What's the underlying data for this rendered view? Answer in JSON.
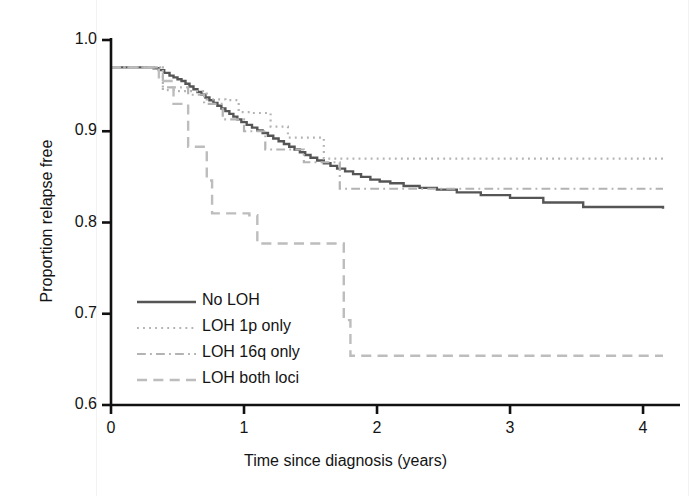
{
  "chart_data": {
    "type": "line",
    "title": "",
    "xlabel": "Time since diagnosis (years)",
    "ylabel": "Proportion relapse free",
    "xlim": [
      0,
      4.15
    ],
    "ylim": [
      0.6,
      1.005
    ],
    "xticks": [
      "0",
      "1",
      "2",
      "3",
      "4"
    ],
    "xtick_values": [
      0,
      1,
      2,
      3,
      4
    ],
    "yticks": [
      "1.0",
      "0.9",
      "0.8",
      "0.7",
      "0.6"
    ],
    "ytick_values": [
      1.0,
      0.9,
      0.8,
      0.7,
      0.6
    ],
    "grid": false,
    "legend_position": "lower-left-inside",
    "step_type": "post",
    "series": [
      {
        "name": "No LOH",
        "style": "solid",
        "color": "#555555",
        "width": 2.4,
        "x": [
          0.0,
          0.25,
          0.32,
          0.36,
          0.4,
          0.44,
          0.47,
          0.5,
          0.53,
          0.56,
          0.59,
          0.62,
          0.65,
          0.68,
          0.71,
          0.74,
          0.77,
          0.8,
          0.83,
          0.86,
          0.89,
          0.92,
          0.95,
          0.98,
          1.02,
          1.06,
          1.1,
          1.14,
          1.18,
          1.22,
          1.26,
          1.3,
          1.34,
          1.38,
          1.42,
          1.46,
          1.5,
          1.55,
          1.6,
          1.65,
          1.7,
          1.76,
          1.82,
          1.88,
          1.95,
          2.02,
          2.1,
          2.2,
          2.32,
          2.45,
          2.6,
          2.78,
          3.0,
          3.25,
          3.55,
          4.15
        ],
        "y": [
          0.97,
          0.97,
          0.969,
          0.967,
          0.964,
          0.961,
          0.959,
          0.957,
          0.955,
          0.952,
          0.949,
          0.946,
          0.943,
          0.94,
          0.937,
          0.934,
          0.931,
          0.928,
          0.925,
          0.922,
          0.919,
          0.916,
          0.913,
          0.91,
          0.907,
          0.904,
          0.901,
          0.898,
          0.895,
          0.892,
          0.889,
          0.886,
          0.883,
          0.88,
          0.877,
          0.874,
          0.871,
          0.868,
          0.865,
          0.862,
          0.859,
          0.856,
          0.853,
          0.85,
          0.847,
          0.845,
          0.843,
          0.84,
          0.838,
          0.836,
          0.833,
          0.83,
          0.827,
          0.822,
          0.817,
          0.815
        ]
      },
      {
        "name": "LOH 1p only",
        "style": "dotted",
        "color": "#b3b3b3",
        "width": 2.2,
        "x": [
          0.0,
          0.39,
          0.39,
          0.5,
          0.5,
          0.72,
          0.72,
          0.86,
          0.86,
          0.96,
          0.96,
          1.06,
          1.06,
          1.2,
          1.2,
          1.33,
          1.33,
          1.6,
          1.6,
          4.15
        ],
        "y": [
          0.97,
          0.97,
          0.945,
          0.945,
          0.944,
          0.944,
          0.935,
          0.935,
          0.934,
          0.934,
          0.921,
          0.921,
          0.92,
          0.92,
          0.905,
          0.905,
          0.893,
          0.893,
          0.87,
          0.87
        ]
      },
      {
        "name": "LOH 16q only",
        "style": "dashdot",
        "color": "#b3b3b3",
        "width": 2.2,
        "x": [
          0.0,
          0.39,
          0.39,
          0.58,
          0.58,
          0.7,
          0.7,
          0.84,
          0.84,
          1.0,
          1.0,
          1.16,
          1.16,
          1.45,
          1.45,
          1.72,
          1.72,
          4.15
        ],
        "y": [
          0.97,
          0.97,
          0.948,
          0.948,
          0.94,
          0.94,
          0.93,
          0.93,
          0.913,
          0.913,
          0.9,
          0.9,
          0.88,
          0.88,
          0.866,
          0.866,
          0.837,
          0.837
        ]
      },
      {
        "name": "LOH both loci",
        "style": "dashed",
        "color": "#bdbdbd",
        "width": 2.4,
        "x": [
          0.0,
          0.36,
          0.36,
          0.47,
          0.47,
          0.58,
          0.58,
          0.72,
          0.72,
          0.76,
          0.76,
          1.04,
          1.04,
          1.1,
          1.1,
          1.75,
          1.75,
          1.8,
          1.8,
          4.15
        ],
        "y": [
          0.97,
          0.97,
          0.955,
          0.955,
          0.93,
          0.93,
          0.883,
          0.883,
          0.846,
          0.846,
          0.81,
          0.81,
          0.808,
          0.808,
          0.777,
          0.777,
          0.693,
          0.693,
          0.654,
          0.654
        ]
      }
    ]
  },
  "legend": {
    "entries": [
      {
        "label": "No LOH"
      },
      {
        "label": "LOH 1p only"
      },
      {
        "label": "LOH 16q only"
      },
      {
        "label": "LOH both loci"
      }
    ]
  }
}
